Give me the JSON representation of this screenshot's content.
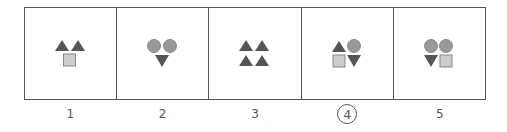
{
  "colors": {
    "triangle": "#555555",
    "circle": "#999999",
    "square": "#cccccc",
    "square_border": "#888888",
    "border": "#555555",
    "label": "#555555"
  },
  "panels": [
    {
      "id": "1",
      "label": "1",
      "shapes": [
        "triangle-up",
        "triangle-up",
        "square"
      ]
    },
    {
      "id": "2",
      "label": "2",
      "shapes": [
        "circle",
        "circle",
        "triangle-down"
      ]
    },
    {
      "id": "3",
      "label": "3",
      "shapes": [
        "triangle-up",
        "triangle-up",
        "triangle-up",
        "triangle-up"
      ]
    },
    {
      "id": "4",
      "label": "4",
      "selected": true,
      "shapes": [
        "triangle-up",
        "circle",
        "square",
        "triangle-down"
      ]
    },
    {
      "id": "5",
      "label": "5",
      "shapes": [
        "circle",
        "circle",
        "triangle-down",
        "square"
      ]
    }
  ]
}
